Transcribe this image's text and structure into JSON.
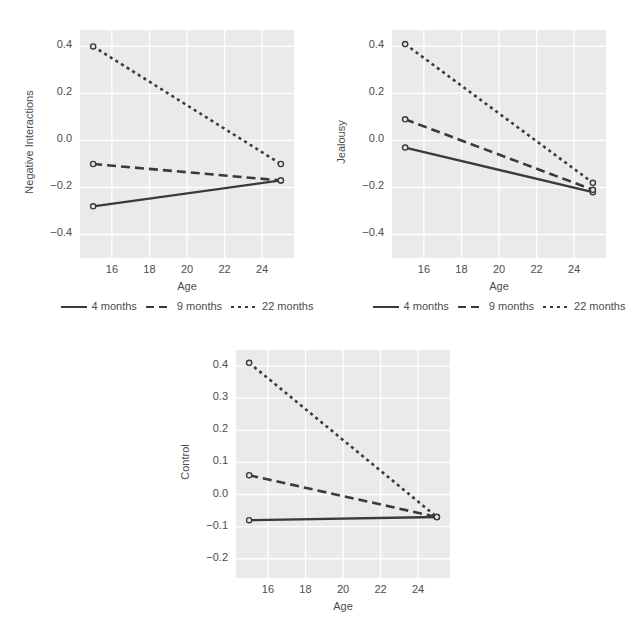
{
  "figure": {
    "caption_fragment": "",
    "background": "#ffffff",
    "panel_background": "#eaeaea",
    "grid_color": "#ffffff",
    "line_color": "#3a3a3a"
  },
  "legend": {
    "items": [
      {
        "label": "4 months",
        "style": "solid"
      },
      {
        "label": "9 months",
        "style": "dashed"
      },
      {
        "label": "22 months",
        "style": "dotted"
      }
    ]
  },
  "chart_data": [
    {
      "type": "line",
      "title": "",
      "xlabel": "Age",
      "ylabel": "Negative Interactions",
      "x": [
        15,
        25
      ],
      "xlim": [
        14.3,
        25.7
      ],
      "ylim": [
        -0.5,
        0.47
      ],
      "xticks": [
        16,
        18,
        20,
        22,
        24
      ],
      "yticks": [
        -0.4,
        -0.2,
        0.0,
        0.2,
        0.4
      ],
      "ytick_labels": [
        "−0.4",
        "−0.2",
        "0.0",
        "0.2",
        "0.4"
      ],
      "grid": true,
      "legend_position": "bottom",
      "series": [
        {
          "name": "4 months",
          "style": "solid",
          "values": [
            -0.28,
            -0.17
          ]
        },
        {
          "name": "9 months",
          "style": "dashed",
          "values": [
            -0.1,
            -0.17
          ]
        },
        {
          "name": "22 months",
          "style": "dotted",
          "values": [
            0.4,
            -0.1
          ]
        }
      ]
    },
    {
      "type": "line",
      "title": "",
      "xlabel": "Age",
      "ylabel": "Jealousy",
      "x": [
        15,
        25
      ],
      "xlim": [
        14.3,
        25.7
      ],
      "ylim": [
        -0.5,
        0.47
      ],
      "xticks": [
        16,
        18,
        20,
        22,
        24
      ],
      "yticks": [
        -0.4,
        -0.2,
        0.0,
        0.2,
        0.4
      ],
      "ytick_labels": [
        "−0.4",
        "−0.2",
        "0.0",
        "0.2",
        "0.4"
      ],
      "grid": true,
      "legend_position": "bottom",
      "series": [
        {
          "name": "4 months",
          "style": "solid",
          "values": [
            -0.03,
            -0.22
          ]
        },
        {
          "name": "9 months",
          "style": "dashed",
          "values": [
            0.09,
            -0.21
          ]
        },
        {
          "name": "22 months",
          "style": "dotted",
          "values": [
            0.41,
            -0.18
          ]
        }
      ]
    },
    {
      "type": "line",
      "title": "",
      "xlabel": "Age",
      "ylabel": "Control",
      "x": [
        15,
        25
      ],
      "xlim": [
        14.3,
        25.7
      ],
      "ylim": [
        -0.26,
        0.45
      ],
      "xticks": [
        16,
        18,
        20,
        22,
        24
      ],
      "yticks": [
        -0.2,
        -0.1,
        0.0,
        0.1,
        0.2,
        0.3,
        0.4
      ],
      "ytick_labels": [
        "−0.2",
        "−0.1",
        "0.0",
        "0.1",
        "0.2",
        "0.3",
        "0.4"
      ],
      "grid": true,
      "legend_position": "bottom",
      "series": [
        {
          "name": "4 months",
          "style": "solid",
          "values": [
            -0.08,
            -0.07
          ]
        },
        {
          "name": "9 months",
          "style": "dashed",
          "values": [
            0.06,
            -0.07
          ]
        },
        {
          "name": "22 months",
          "style": "dotted",
          "values": [
            0.41,
            -0.07
          ]
        }
      ]
    }
  ]
}
